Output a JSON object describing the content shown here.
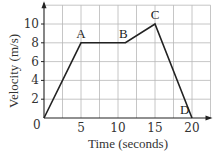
{
  "chart_data": {
    "type": "line",
    "title": "",
    "xlabel": "Time (seconds)",
    "ylabel": "Velocity (m/s)",
    "xlim": [
      0,
      22.5
    ],
    "ylim": [
      0,
      12
    ],
    "x_ticks": [
      0,
      5,
      10,
      15,
      20
    ],
    "y_ticks": [
      2,
      4,
      6,
      8,
      10
    ],
    "x_tick_labels": [
      "0",
      "5",
      "10",
      "15",
      "20"
    ],
    "y_tick_labels": [
      "2",
      "4",
      "6",
      "8",
      "10"
    ],
    "grid": true,
    "grid_x_step": 2.5,
    "grid_y_step": 2,
    "legend": null,
    "series": [
      {
        "name": "velocity",
        "x": [
          0,
          5,
          11,
          15,
          20
        ],
        "y": [
          0,
          8,
          8,
          10,
          0
        ]
      }
    ],
    "annotations": [
      {
        "text": "A",
        "x": 5,
        "y": 8
      },
      {
        "text": "B",
        "x": 11,
        "y": 8
      },
      {
        "text": "C",
        "x": 15,
        "y": 10
      },
      {
        "text": "D",
        "x": 19,
        "y": 0
      }
    ],
    "origin_label": "0"
  }
}
